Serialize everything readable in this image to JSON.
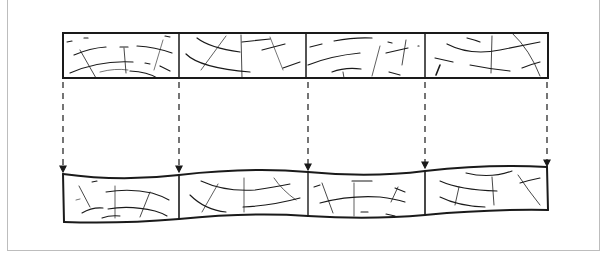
{
  "diagram": {
    "title": "",
    "top_strip": {
      "segments": 4,
      "x_bounds": [
        63,
        179,
        306,
        425,
        548
      ],
      "y_top": 33,
      "y_bottom": 78
    },
    "bottom_strip": {
      "segments": 4,
      "x_bounds": [
        63,
        179,
        306,
        425,
        548
      ],
      "shape": "wavy"
    },
    "arrows": {
      "count": 5,
      "style": "dashed",
      "direction": "down"
    },
    "colors": {
      "stroke": "#1a1a1a",
      "frame": "#bdbdbd",
      "background": "#ffffff"
    }
  }
}
